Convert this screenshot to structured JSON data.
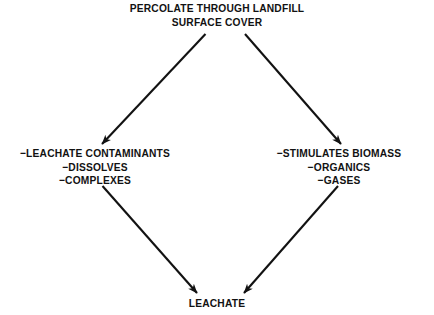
{
  "diagram": {
    "type": "flow-diagram",
    "colors": {
      "background": "#ffffff",
      "stroke": "#121212",
      "text": "#121212"
    },
    "nodes": [
      {
        "id": "source",
        "name": "percolate-source",
        "lines": [
          "PERCOLATE THROUGH LANDFILL",
          "SURFACE COVER"
        ]
      },
      {
        "id": "contaminants",
        "name": "leachate-contaminants",
        "lines": [
          "−LEACHATE CONTAMINANTS",
          "−DISSOLVES",
          "−COMPLEXES"
        ]
      },
      {
        "id": "biomass",
        "name": "stimulates-biomass",
        "lines": [
          "−STIMULATES BIOMASS",
          "−ORGANICS",
          "−GASES"
        ]
      },
      {
        "id": "leachate",
        "name": "leachate-result",
        "lines": [
          "LEACHATE"
        ]
      }
    ],
    "edges": [
      {
        "id": "edge-source-contaminants",
        "from": "source",
        "to": "contaminants"
      },
      {
        "id": "edge-source-biomass",
        "from": "source",
        "to": "biomass"
      },
      {
        "id": "edge-contaminants-leachate",
        "from": "contaminants",
        "to": "leachate"
      },
      {
        "id": "edge-biomass-leachate",
        "from": "biomass",
        "to": "leachate"
      }
    ]
  }
}
